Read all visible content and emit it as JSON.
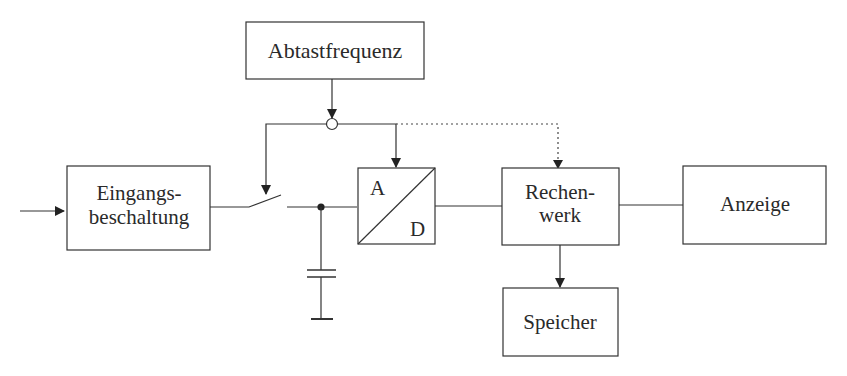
{
  "diagram": {
    "type": "block-diagram",
    "blocks": {
      "abtastfrequenz": {
        "label": "Abtastfrequenz"
      },
      "eingangsbeschaltung": {
        "line1": "Eingangs-",
        "line2": "beschaltung"
      },
      "ad_converter": {
        "top": "A",
        "bottom": "D"
      },
      "rechenwerk": {
        "line1": "Rechen-",
        "line2": "werk"
      },
      "anzeige": {
        "label": "Anzeige"
      },
      "speicher": {
        "label": "Speicher"
      }
    },
    "connections": [
      {
        "from": "input",
        "to": "eingangsbeschaltung",
        "style": "arrow"
      },
      {
        "from": "eingangsbeschaltung",
        "to": "sample-switch",
        "style": "line"
      },
      {
        "from": "sample-switch",
        "to": "hold-capacitor-node",
        "style": "line"
      },
      {
        "from": "hold-capacitor-node",
        "to": "ad_converter",
        "style": "line"
      },
      {
        "from": "abtastfrequenz",
        "to": "clock-junction",
        "style": "arrow"
      },
      {
        "from": "clock-junction",
        "to": "sample-switch",
        "style": "arrow"
      },
      {
        "from": "clock-junction",
        "to": "ad_converter",
        "style": "arrow"
      },
      {
        "from": "clock-junction",
        "to": "rechenwerk",
        "style": "dotted-arrow"
      },
      {
        "from": "ad_converter",
        "to": "rechenwerk",
        "style": "line"
      },
      {
        "from": "rechenwerk",
        "to": "anzeige",
        "style": "line"
      },
      {
        "from": "rechenwerk",
        "to": "speicher",
        "style": "arrow"
      }
    ],
    "colors": {
      "line": "#333333",
      "text": "#2a2a2a",
      "background": "#ffffff"
    }
  }
}
